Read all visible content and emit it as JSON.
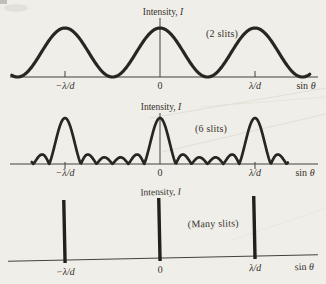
{
  "page": {
    "background_color": "#f0eee8",
    "ink_color": "#282622",
    "text_color": "#35322b"
  },
  "chart_data": [
    {
      "type": "line",
      "name": "two-slit-interference-pattern",
      "ylabel_prefix": "Intensity, ",
      "ylabel_symbol": "I",
      "xlabel_prefix": "sin ",
      "xlabel_symbol": "θ",
      "annotation": "(2 slits)",
      "n_slits": 2,
      "kind": "cos2",
      "curve_formula": "I = cos²(πu), u = sinθ/(λ/d)",
      "principal_maxima_u": [
        -1,
        0,
        1
      ],
      "peak_intensity_relative": 1,
      "x_range_u": [
        -1.6,
        1.6
      ],
      "y_range": [
        0,
        1
      ],
      "grid": false,
      "x_ticks": [
        {
          "u": -1,
          "label": "−λ/d"
        },
        {
          "u": 0,
          "label": "0"
        },
        {
          "u": 1,
          "label": "λ/d"
        }
      ],
      "layout": {
        "cx": 160,
        "unit": 95,
        "base": 77,
        "peak": 49,
        "vtop": 18,
        "x0": 10,
        "x1": 318,
        "tick_up": 6,
        "tick_down": 0,
        "label_y": 89,
        "sin_x": 306,
        "sw": 3.2,
        "u_min": -1.56,
        "u_max": 1.58,
        "exp": 1,
        "rotate": ""
      }
    },
    {
      "type": "line",
      "name": "six-slit-grating-pattern",
      "ylabel_prefix": "Intensity, ",
      "ylabel_symbol": "I",
      "xlabel_prefix": "sin ",
      "xlabel_symbol": "θ",
      "annotation": "(6 slits)",
      "n_slits": 6,
      "kind": "grating",
      "curve_formula": "I = (sin(6πu)/(6·sin(πu)))², u = sinθ/(λ/d)",
      "principal_maxima_u": [
        -1,
        0,
        1
      ],
      "secondary_maxima_between_principal": 4,
      "peak_intensity_relative": 1,
      "x_range_u": [
        -1.6,
        1.6
      ],
      "y_range": [
        0,
        1
      ],
      "grid": false,
      "x_ticks": [
        {
          "u": -1,
          "label": "−λ/d"
        },
        {
          "u": 0,
          "label": "0"
        },
        {
          "u": 1,
          "label": "λ/d"
        }
      ],
      "layout": {
        "cx": 160,
        "unit": 95,
        "base": 164,
        "peak": 46,
        "vtop": 113,
        "x0": 10,
        "x1": 318,
        "tick_up": 2,
        "tick_down": 5,
        "label_y": 176,
        "sin_x": 305,
        "sw": 2.7,
        "u_min": -1.35,
        "u_max": 1.35,
        "exp": 0.55,
        "rotate": ""
      }
    },
    {
      "type": "line",
      "name": "many-slit-grating-pattern",
      "ylabel_prefix": "Intensity, ",
      "ylabel_symbol": "I",
      "xlabel_prefix": "sin ",
      "xlabel_symbol": "θ",
      "annotation": "(Many slits)",
      "n_slits": "many",
      "kind": "delta",
      "curve_formula": "sharp principal maxima (delta-like lines) at u = −1, 0, 1",
      "principal_maxima_u": [
        -1,
        0,
        1
      ],
      "peak_intensity_relative": 1,
      "x_range_u": [
        -1.6,
        1.6
      ],
      "y_range": [
        0,
        1
      ],
      "grid": false,
      "x_ticks": [
        {
          "u": -1,
          "label": "−λ/d"
        },
        {
          "u": 0,
          "label": "0"
        },
        {
          "u": 1,
          "label": "λ/d"
        }
      ],
      "layout": {
        "cx": 160,
        "unit": 95,
        "base": 258,
        "peak": 60,
        "vtop": 0,
        "x0": 8,
        "x1": 318,
        "tick_up": 0,
        "tick_down": 0,
        "label_y": 273,
        "sin_x": 304,
        "sw": 3.4,
        "overhang": 3,
        "u_min": 0,
        "u_max": 0,
        "exp": 1,
        "rotate": "-1.2 160 258"
      }
    }
  ]
}
